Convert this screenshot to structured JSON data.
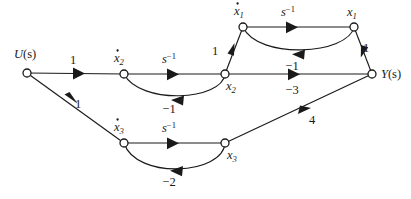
{
  "figure": {
    "type": "signal-flow-graph",
    "width": 411,
    "height": 199,
    "background_color": "#ffffff",
    "line_color": "#1a1a1a"
  },
  "nodes": [
    {
      "id": "U",
      "label": "U(s)",
      "base": "U",
      "sub": "",
      "paren": "(s)",
      "dot": false,
      "x": 27,
      "y": 73,
      "label_x": 14,
      "label_y": 58
    },
    {
      "id": "x2dot",
      "label": "ẋ2",
      "base": "x",
      "sub": "2",
      "paren": "",
      "dot": true,
      "x": 124,
      "y": 74,
      "label_x": 114,
      "label_y": 62
    },
    {
      "id": "x2",
      "label": "x2",
      "base": "x",
      "sub": "2",
      "paren": "",
      "dot": false,
      "x": 225,
      "y": 74,
      "label_x": 226,
      "label_y": 90
    },
    {
      "id": "x1dot",
      "label": "ẋ1",
      "base": "x",
      "sub": "1",
      "paren": "",
      "dot": true,
      "x": 243,
      "y": 27,
      "label_x": 234,
      "label_y": 15
    },
    {
      "id": "x1",
      "label": "x1",
      "base": "x",
      "sub": "1",
      "paren": "",
      "dot": false,
      "x": 354,
      "y": 27,
      "label_x": 347,
      "label_y": 16
    },
    {
      "id": "Y",
      "label": "Y(s)",
      "base": "Y",
      "sub": "",
      "paren": "(s)",
      "dot": false,
      "x": 372,
      "y": 74,
      "label_x": 381,
      "label_y": 78
    },
    {
      "id": "x3dot",
      "label": "ẋ3",
      "base": "x",
      "sub": "3",
      "paren": "",
      "dot": true,
      "x": 124,
      "y": 143,
      "label_x": 114,
      "label_y": 131
    },
    {
      "id": "x3",
      "label": "x3",
      "base": "x",
      "sub": "3",
      "paren": "",
      "dot": false,
      "x": 225,
      "y": 143,
      "label_x": 227,
      "label_y": 159
    }
  ],
  "edges": [
    {
      "id": "U-x2dot",
      "from": "U",
      "to": "x2dot",
      "gain": "1",
      "gain_base": "1",
      "gain_sup": "",
      "italic": false,
      "label_x": 73,
      "label_y": 64,
      "shape": "straight"
    },
    {
      "id": "x2dot-x2",
      "from": "x2dot",
      "to": "x2",
      "gain": "s-1",
      "gain_base": "s",
      "gain_sup": "−1",
      "italic": true,
      "label_x": 169,
      "label_y": 63,
      "shape": "straight"
    },
    {
      "id": "x2-x2dot",
      "from": "x2",
      "to": "x2dot",
      "gain": "−1",
      "gain_base": "−1",
      "gain_sup": "",
      "italic": false,
      "label_x": 169,
      "label_y": 113,
      "shape": "curve-below"
    },
    {
      "id": "x2-x1dot",
      "from": "x2",
      "to": "x1dot",
      "gain": "1",
      "gain_base": "1",
      "gain_sup": "",
      "italic": false,
      "label_x": 215,
      "label_y": 55,
      "shape": "straight"
    },
    {
      "id": "x1dot-x1",
      "from": "x1dot",
      "to": "x1",
      "gain": "s-1",
      "gain_base": "s",
      "gain_sup": "−1",
      "italic": true,
      "label_x": 288,
      "label_y": 16,
      "shape": "straight"
    },
    {
      "id": "x1-x1dot",
      "from": "x1",
      "to": "x1dot",
      "gain": "−1",
      "gain_base": "−1",
      "gain_sup": "",
      "italic": false,
      "label_x": 292,
      "label_y": 70,
      "shape": "curve-below"
    },
    {
      "id": "x1-Y",
      "from": "x1",
      "to": "Y",
      "gain": "1",
      "gain_base": "1",
      "gain_sup": "",
      "italic": false,
      "label_x": 366,
      "label_y": 52,
      "shape": "straight"
    },
    {
      "id": "x2-Y",
      "from": "x2",
      "to": "Y",
      "gain": "−3",
      "gain_base": "−3",
      "gain_sup": "",
      "italic": false,
      "label_x": 292,
      "label_y": 94,
      "shape": "straight"
    },
    {
      "id": "U-x3dot",
      "from": "U",
      "to": "x3dot",
      "gain": "1",
      "gain_base": "1",
      "gain_sup": "",
      "italic": false,
      "label_x": 78,
      "label_y": 108,
      "shape": "straight"
    },
    {
      "id": "x3dot-x3",
      "from": "x3dot",
      "to": "x3",
      "gain": "s-1",
      "gain_base": "s",
      "gain_sup": "−1",
      "italic": true,
      "label_x": 169,
      "label_y": 132,
      "shape": "straight"
    },
    {
      "id": "x3-x3dot",
      "from": "x3",
      "to": "x3dot",
      "gain": "−2",
      "gain_base": "−2",
      "gain_sup": "",
      "italic": false,
      "label_x": 169,
      "label_y": 186,
      "shape": "curve-below"
    },
    {
      "id": "x3-Y",
      "from": "x3",
      "to": "Y",
      "gain": "4",
      "gain_base": "4",
      "gain_sup": "",
      "italic": false,
      "label_x": 312,
      "label_y": 124,
      "shape": "straight"
    }
  ]
}
